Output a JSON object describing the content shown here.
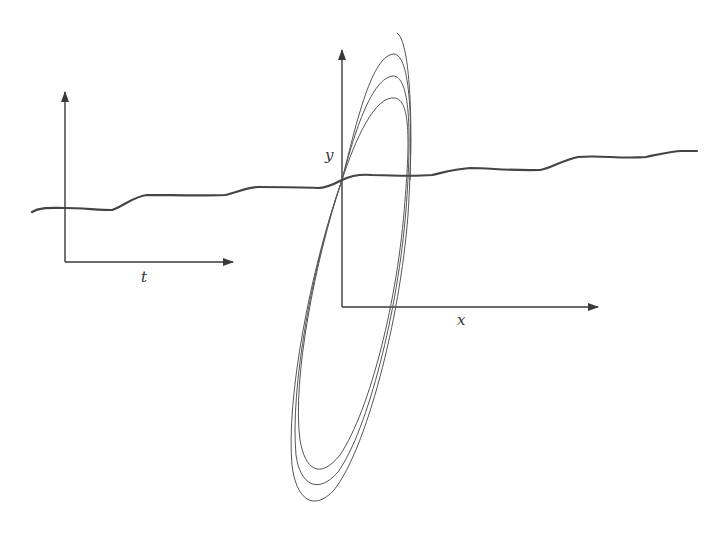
{
  "left_panel": {
    "x_axis_label": "t"
  },
  "right_panel": {
    "x_axis_label": "x",
    "y_axis_label": "y"
  },
  "colors": {
    "ink": "#3a3a3a",
    "background": "#ffffff"
  }
}
